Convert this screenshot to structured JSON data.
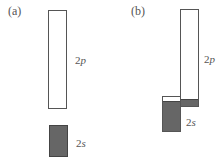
{
  "panels": [
    {
      "label": "(a)",
      "orbitals": [
        {
          "name_num": "2",
          "name_letter": "p",
          "state": "empty"
        },
        {
          "name_num": "2",
          "name_letter": "s",
          "state": "filled"
        }
      ]
    },
    {
      "label": "(b)",
      "orbitals": [
        {
          "name_num": "2",
          "name_letter": "p",
          "state": "partially filled (bottom)"
        },
        {
          "name_num": "2",
          "name_letter": "s",
          "state": "partially filled (top emptied)"
        }
      ]
    }
  ],
  "colors": {
    "filled": "#666666",
    "outline": "#555555",
    "empty": "#ffffff"
  }
}
